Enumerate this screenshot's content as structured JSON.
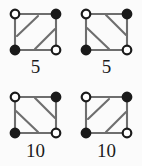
{
  "figure": {
    "background_color": "#fbfbfb",
    "edge_color": "#6e6e6e",
    "node_stroke_color": "#1a1a1a",
    "node_filled_color": "#1a1a1a",
    "node_open_color": "#ffffff",
    "label_color": "#1c1c1c"
  },
  "graphs": [
    {
      "id": "graph-1",
      "caption": "5",
      "position": "top-left",
      "nodes": [
        {
          "id": "top-left",
          "fill": "open"
        },
        {
          "id": "top-right",
          "fill": "filled"
        },
        {
          "id": "bottom-left",
          "fill": "filled"
        },
        {
          "id": "bottom-right",
          "fill": "open"
        }
      ],
      "edges": [
        {
          "from": "top-left",
          "to": "top-right",
          "kind": "side"
        },
        {
          "from": "top-left",
          "to": "bottom-left",
          "kind": "side"
        },
        {
          "from": "top-right",
          "to": "bottom-right",
          "kind": "side"
        },
        {
          "from": "bottom-left",
          "to": "bottom-right",
          "kind": "side"
        },
        {
          "from": "bottom-left",
          "to": "top-right",
          "kind": "diagonal"
        }
      ],
      "chords": "two parallel chords rising left-to-right"
    },
    {
      "id": "graph-2",
      "caption": "5",
      "position": "top-right",
      "nodes": [
        {
          "id": "top-left",
          "fill": "open"
        },
        {
          "id": "top-right",
          "fill": "filled"
        },
        {
          "id": "bottom-left",
          "fill": "filled"
        },
        {
          "id": "bottom-right",
          "fill": "open"
        }
      ],
      "edges": [
        {
          "from": "top-left",
          "to": "top-right",
          "kind": "side"
        },
        {
          "from": "top-left",
          "to": "bottom-left",
          "kind": "side"
        },
        {
          "from": "top-right",
          "to": "bottom-right",
          "kind": "side"
        },
        {
          "from": "bottom-left",
          "to": "bottom-right",
          "kind": "side"
        },
        {
          "from": "top-left",
          "to": "bottom-right",
          "kind": "diagonal"
        }
      ],
      "chords": "two parallel chords falling left-to-right"
    },
    {
      "id": "graph-3",
      "caption": "10",
      "position": "bottom-left",
      "nodes": [
        {
          "id": "top-left",
          "fill": "open"
        },
        {
          "id": "top-right",
          "fill": "filled"
        },
        {
          "id": "bottom-left",
          "fill": "filled"
        },
        {
          "id": "bottom-right",
          "fill": "open"
        }
      ],
      "edges": [
        {
          "from": "top-left",
          "to": "top-right",
          "kind": "side"
        },
        {
          "from": "top-left",
          "to": "bottom-left",
          "kind": "side"
        },
        {
          "from": "top-right",
          "to": "bottom-right",
          "kind": "side"
        },
        {
          "from": "bottom-left",
          "to": "bottom-right",
          "kind": "side"
        },
        {
          "from": "top-left",
          "to": "bottom-right",
          "kind": "diagonal"
        }
      ],
      "chords": "two parallel chords falling left-to-right"
    },
    {
      "id": "graph-4",
      "caption": "10",
      "position": "bottom-right",
      "nodes": [
        {
          "id": "top-left",
          "fill": "open"
        },
        {
          "id": "top-right",
          "fill": "filled"
        },
        {
          "id": "bottom-left",
          "fill": "filled"
        },
        {
          "id": "bottom-right",
          "fill": "open"
        }
      ],
      "edges": [
        {
          "from": "top-left",
          "to": "top-right",
          "kind": "side"
        },
        {
          "from": "top-left",
          "to": "bottom-left",
          "kind": "side"
        },
        {
          "from": "top-right",
          "to": "bottom-right",
          "kind": "side"
        },
        {
          "from": "bottom-left",
          "to": "bottom-right",
          "kind": "side"
        },
        {
          "from": "bottom-left",
          "to": "top-right",
          "kind": "diagonal"
        }
      ],
      "chords": "two parallel chords rising left-to-right"
    }
  ]
}
